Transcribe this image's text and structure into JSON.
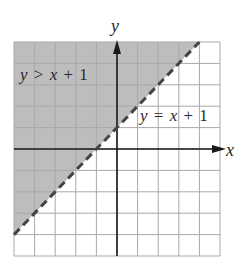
{
  "chart_data": {
    "type": "line",
    "title": "",
    "xlabel": "x",
    "ylabel": "y",
    "xlim": [
      -5,
      5
    ],
    "ylim": [
      -5,
      5
    ],
    "grid": true,
    "grid_step": 1,
    "series": [
      {
        "name": "y = x + 1",
        "style": "dashed",
        "x": [
          -5,
          4
        ],
        "y": [
          -4,
          5
        ]
      }
    ],
    "shaded_region": {
      "inequality": "y > x + 1",
      "side": "above",
      "boundary": "dashed (strict inequality)"
    },
    "annotations": [
      {
        "text": "y > x + 1",
        "position": "upper-left, in shaded region"
      },
      {
        "text": "y = x + 1",
        "position": "right of line, near (3, 1.5)"
      }
    ]
  },
  "labels": {
    "x_axis": "x",
    "y_axis": "y",
    "region_label": {
      "var": "y",
      "op": ">",
      "rhs_var": "x",
      "plus": "+",
      "const": "1"
    },
    "line_label": {
      "var": "y",
      "op": "=",
      "rhs_var": "x",
      "plus": "+",
      "const": "1"
    }
  },
  "colors": {
    "shade": "#bdbdbd",
    "grid": "#a9a9a9",
    "axis": "#1a1a1a",
    "boundary": "#444444"
  }
}
